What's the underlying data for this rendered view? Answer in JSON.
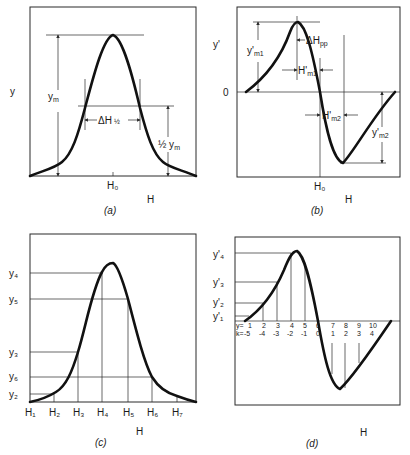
{
  "panels": {
    "a": {
      "caption": "(a)",
      "y_label": "y",
      "x_label": "H",
      "x_tick": "H₀",
      "ym_label": "y",
      "ym_sub": "m",
      "half_ym_label": "½ y",
      "half_ym_sub": "m",
      "dh_half_label": "ΔH",
      "dh_half_sub": "½"
    },
    "b": {
      "caption": "(b)",
      "y_label": "y'",
      "x_label": "H",
      "x_tick": "H₀",
      "zero_label": "0",
      "ym1_label": "y'",
      "ym1_sub": "m1",
      "ym2_label": "y'",
      "ym2_sub": "m2",
      "dhpp_label": "ΔH",
      "dhpp_sub": "pp",
      "hm1_label": "H'",
      "hm1_sub": "m1",
      "hm2_label": "H'",
      "hm2_sub": "m2"
    },
    "c": {
      "caption": "(c)",
      "x_label": "H",
      "x_ticks": [
        "H₁",
        "H₂",
        "H₃",
        "H₄",
        "H₅",
        "H₆",
        "H₇"
      ],
      "y_ticks": [
        "y₄",
        "y₅",
        "y₃",
        "y₆",
        "y₂"
      ]
    },
    "d": {
      "caption": "(d)",
      "x_label": "H",
      "y_ticks": [
        "y'₄",
        "y'₃",
        "y'₂",
        "y'₁"
      ],
      "row1_prefix": "y=",
      "row2_prefix": "k=",
      "y_index": [
        "1",
        "2",
        "3",
        "4",
        "5",
        "6",
        "7",
        "8",
        "9",
        "10"
      ],
      "k_index": [
        "-5",
        "-4",
        "-3",
        "-2",
        "-1",
        "0",
        "1",
        "2",
        "3",
        "4"
      ]
    }
  }
}
